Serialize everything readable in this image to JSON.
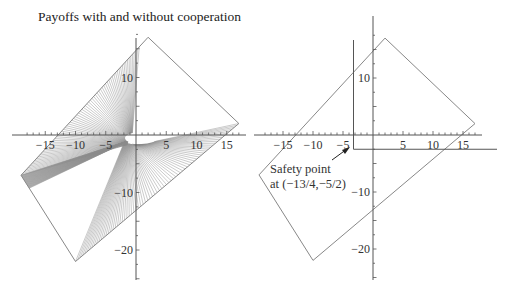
{
  "title": "Payoffs with and without cooperation",
  "annotation": {
    "line1": "Safety point",
    "line2": "at (−13/4,−5/2)"
  },
  "chart_data": [
    {
      "type": "area",
      "title": "Payoffs with and without cooperation",
      "xlabel": "",
      "ylabel": "",
      "x_ticks": [
        -15,
        -10,
        -5,
        5,
        10,
        15
      ],
      "y_ticks": [
        10,
        -10,
        -20
      ],
      "xlim": [
        -19,
        17.5
      ],
      "ylim": [
        -25,
        19
      ],
      "grid": false,
      "cooperative_region_vertices": [
        [
          2,
          17
        ],
        [
          17,
          2
        ],
        [
          -10,
          -22
        ],
        [
          -19,
          -7
        ]
      ],
      "noncooperative_region": "hatched set of payoff lines fanning out from near origin, filling two wedge-shaped regions within the quadrilateral"
    },
    {
      "type": "line",
      "title": "",
      "xlabel": "",
      "ylabel": "",
      "x_ticks": [
        -15,
        -10,
        -5,
        5,
        10,
        15
      ],
      "y_ticks": [
        10,
        -10,
        -20
      ],
      "xlim": [
        -19,
        17.5
      ],
      "ylim": [
        -25,
        19
      ],
      "grid": false,
      "cooperative_region_vertices": [
        [
          2,
          17
        ],
        [
          17,
          2
        ],
        [
          -10,
          -22
        ],
        [
          -19,
          -7
        ]
      ],
      "safety_point": {
        "x": -3.25,
        "y": -2.5,
        "label": "Safety point at (−13/4,−5/2)"
      },
      "safety_lines": {
        "vertical_x": -3.25,
        "horizontal_y": -2.5
      }
    }
  ],
  "colors": {
    "axis": "#555555",
    "polygon": "#888888",
    "hatch": "#8a8a8a",
    "text": "#333333"
  }
}
